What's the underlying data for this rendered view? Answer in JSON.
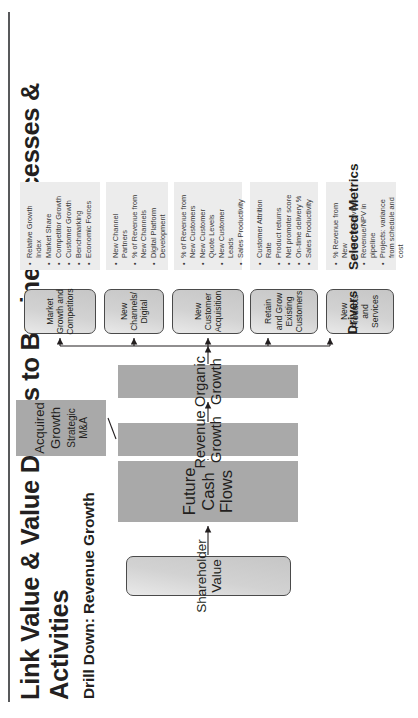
{
  "header": {
    "title": "Link Value & Value Drivers to Business Processes & Activities",
    "subtitle": "Drill Down: Revenue Growth"
  },
  "row_labels": {
    "drivers": "Drivers",
    "metrics": "Selected Metrics"
  },
  "chain": {
    "shareholder_value": "Shareholder Value",
    "future_cash_flows": "Future Cash Flows",
    "revenue_growth": "Revenue Growth",
    "organic_growth": "Organic Growth",
    "acquired_growth": "Acquired Growth",
    "acquired_growth_sub": "Strategic M&A"
  },
  "drivers": [
    {
      "label": "New Products and Services"
    },
    {
      "label": "Retain and Grow Existing Customers"
    },
    {
      "label": "New Customer Acquisition"
    },
    {
      "label": "New Channels/ Digital"
    },
    {
      "label": "Market Growth and Competitors"
    }
  ],
  "metrics": [
    {
      "for": "New Products and Services",
      "items": [
        "% Revenue from New Products/Services",
        "Revenue/NPV in pipeline",
        "Projects: variance from schedule and cost"
      ]
    },
    {
      "for": "Retain and Grow Existing Customers",
      "items": [
        "Customer Attrition Rate",
        "Product returns",
        "Net promoter score",
        "On-time delivery %",
        "Sales Productivity"
      ]
    },
    {
      "for": "New Customer Acquisition",
      "items": [
        "% of Revenue from New Customers",
        "New Customer Quote Levels",
        "New Customer Leads",
        "Sales Productivity"
      ]
    },
    {
      "for": "New Channels/ Digital",
      "items": [
        "New Channel Partners",
        "% of Revenue from New Channels",
        "Digital Platform Development"
      ]
    },
    {
      "for": "Market Growth and Competitors",
      "items": [
        "Relative Growth Index",
        "Market Share",
        "Competitor Growth",
        "Customer Growth",
        "Benchmarking",
        "Economic Forces"
      ]
    }
  ],
  "colors": {
    "ink": "#231f20",
    "chain_fill": "#a9a9a9",
    "driver_fill": "#d2d2d2",
    "metrics_fill": "#ececec",
    "rule": "#58595b"
  }
}
